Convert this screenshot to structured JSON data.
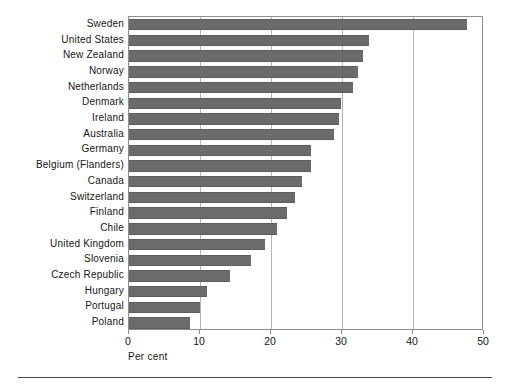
{
  "chart_data": {
    "type": "bar",
    "orientation": "horizontal",
    "title": "",
    "subtitle": "",
    "xlabel": "Per cent",
    "ylabel": "",
    "xlim": [
      0,
      50
    ],
    "xticks": [
      0,
      10,
      20,
      30,
      40,
      50
    ],
    "xticklabels": [
      "0",
      "10",
      "20",
      "30",
      "40",
      "50"
    ],
    "grid": "vertical-at-xticks",
    "legend": null,
    "bar_color": "#6b6b6b",
    "frame_color": "#8e8e8e",
    "gridline_color": "#b4b4b4",
    "categories": [
      "Sweden",
      "United States",
      "New Zealand",
      "Norway",
      "Netherlands",
      "Denmark",
      "Ireland",
      "Australia",
      "Germany",
      "Belgium (Flanders)",
      "Canada",
      "Switzerland",
      "Finland",
      "Chile",
      "United Kingdom",
      "Slovenia",
      "Czech Republic",
      "Hungary",
      "Portugal",
      "Poland"
    ],
    "values": [
      47.6,
      33.8,
      33.0,
      32.3,
      31.5,
      29.8,
      29.6,
      28.9,
      25.7,
      25.6,
      24.3,
      23.4,
      22.3,
      20.9,
      19.1,
      17.2,
      14.2,
      11.0,
      10.0,
      8.6
    ]
  },
  "axis": {
    "x_title": "Per cent"
  }
}
